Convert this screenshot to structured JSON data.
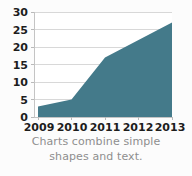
{
  "chart_data": {
    "type": "area",
    "title": "",
    "xlabel": "",
    "ylabel": "",
    "categories": [
      "2009",
      "2010",
      "2011",
      "2012",
      "2013"
    ],
    "values": [
      3,
      5,
      17,
      22,
      27
    ],
    "series": [
      {
        "name": "Series 1",
        "values": [
          3,
          5,
          17,
          22,
          27
        ]
      }
    ],
    "ylim": [
      0,
      30
    ],
    "yticks": [
      0,
      5,
      10,
      15,
      20,
      25,
      30
    ],
    "ytick_labels": [
      "0",
      "5",
      "10",
      "15",
      "20",
      "25",
      "30"
    ],
    "xtick_labels": [
      "2009",
      "2010",
      "2011",
      "2012",
      "2013"
    ],
    "grid": "horizontal",
    "legend": "none",
    "colors": {
      "area_fill": "#447a8a",
      "gridline": "#d8d8d8",
      "axis": "#c4c4c4",
      "tick_text": "#1d1d1d",
      "caption_text": "#8e8e8e",
      "background": "#fcfcfc"
    }
  },
  "caption": {
    "line1": "Charts combine simple",
    "line2": "shapes and text."
  }
}
